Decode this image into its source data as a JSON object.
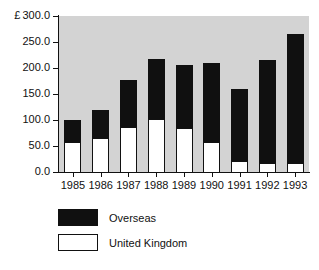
{
  "chart_data": {
    "type": "bar",
    "subtype": "stacked-vertical",
    "title": "",
    "xlabel": "",
    "ylabel": "£",
    "categories": [
      "1985",
      "1986",
      "1987",
      "1988",
      "1989",
      "1990",
      "1991",
      "1992",
      "1993"
    ],
    "series": [
      {
        "name": "United Kingdom",
        "color": "#ffffff",
        "values": [
          57,
          66,
          86,
          101,
          84,
          58,
          21,
          18,
          18
        ]
      },
      {
        "name": "Overseas",
        "color": "#101010",
        "values": [
          43,
          54,
          90,
          117,
          122,
          152,
          138,
          198,
          248
        ]
      }
    ],
    "totals": [
      100,
      120,
      176,
      218,
      206,
      210,
      159,
      216,
      266
    ],
    "ylim": [
      0.0,
      300.0
    ],
    "yticks": [
      0.0,
      50.0,
      100.0,
      150.0,
      200.0,
      250.0,
      300.0
    ],
    "ytick_labels": [
      "0.0",
      "50.0",
      "100.0",
      "150.0",
      "200.0",
      "250.0",
      "300.0"
    ],
    "currency_symbol": "£",
    "currency_on_tick": "300.0",
    "grid": false,
    "legend_position": "below-left",
    "plot_background": "#d3d3d3",
    "figure_background": "#ffffff"
  },
  "axes": {
    "y": {
      "unit_symbol": "£",
      "ticks": [
        {
          "value": 300.0,
          "label": "300.0",
          "prefix": "£"
        },
        {
          "value": 250.0,
          "label": "250.0",
          "prefix": ""
        },
        {
          "value": 200.0,
          "label": "200.0",
          "prefix": ""
        },
        {
          "value": 150.0,
          "label": "150.0",
          "prefix": ""
        },
        {
          "value": 100.0,
          "label": "100.0",
          "prefix": ""
        },
        {
          "value": 50.0,
          "label": "50.0",
          "prefix": ""
        },
        {
          "value": 0.0,
          "label": "0.0",
          "prefix": ""
        }
      ]
    },
    "x": {
      "ticks": [
        "1985",
        "1986",
        "1987",
        "1988",
        "1989",
        "1990",
        "1991",
        "1992",
        "1993"
      ]
    }
  },
  "legend": {
    "items": [
      {
        "label": "Overseas",
        "swatch": "black"
      },
      {
        "label": "United Kingdom",
        "swatch": "white"
      }
    ]
  }
}
